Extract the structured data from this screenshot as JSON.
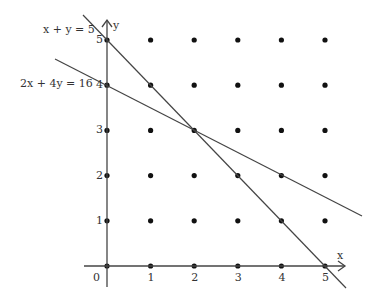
{
  "chart_data": {
    "type": "scatter",
    "title": "",
    "xlabel": "x",
    "ylabel": "y",
    "xlim": [
      0,
      5
    ],
    "ylim": [
      0,
      5
    ],
    "grid": false,
    "x_ticks": [
      "0",
      "1",
      "2",
      "3",
      "4",
      "5"
    ],
    "y_ticks": [
      "1",
      "2",
      "3",
      "4",
      "5"
    ],
    "lattice_points": "all integer points (x,y) with 0<=x<=5, 0<=y<=5",
    "series": [
      {
        "name": "x + y = 5",
        "type": "line",
        "points": [
          [
            0,
            5
          ],
          [
            5,
            0
          ]
        ]
      },
      {
        "name": "2x + 4y = 16",
        "type": "line",
        "points": [
          [
            0,
            4
          ],
          [
            8,
            0
          ]
        ]
      }
    ],
    "annotations": [
      "x + y = 5",
      "2x + 4y = 16"
    ],
    "intersection": [
      2,
      3
    ]
  },
  "labels": {
    "line1": "x + y = 5",
    "line2": "2x + 4y = 16",
    "x_axis": "x",
    "y_axis": "y",
    "origin": "0"
  }
}
